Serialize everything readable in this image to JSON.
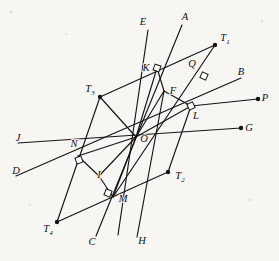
{
  "figure": {
    "ink_color": "#161412",
    "paper_color": "#f7f6f3",
    "width": 279,
    "height": 261
  },
  "points": [
    {
      "id": "A",
      "label": "A",
      "sub": "",
      "x": 185,
      "y": 18,
      "lx": 185,
      "ly": 18,
      "dot": false
    },
    {
      "id": "E",
      "label": "E",
      "sub": "",
      "x": 143,
      "y": 23,
      "lx": 143,
      "ly": 23,
      "dot": false
    },
    {
      "id": "T1",
      "label": "T",
      "sub": "1",
      "x": 215,
      "y": 45,
      "lx": 225,
      "ly": 39,
      "dot": true
    },
    {
      "id": "B",
      "label": "B",
      "sub": "",
      "x": 241,
      "y": 73,
      "lx": 241,
      "ly": 73,
      "dot": false
    },
    {
      "id": "K",
      "label": "K",
      "sub": "",
      "x": 157,
      "y": 68,
      "lx": 146,
      "ly": 69,
      "dot": false
    },
    {
      "id": "Q",
      "label": "Q",
      "sub": "",
      "x": 204,
      "y": 76,
      "lx": 192,
      "ly": 65,
      "dot": false
    },
    {
      "id": "P",
      "label": "P",
      "sub": "",
      "x": 258,
      "y": 99,
      "lx": 265,
      "ly": 99,
      "dot": true
    },
    {
      "id": "T3",
      "label": "T",
      "sub": "3",
      "x": 100,
      "y": 97,
      "lx": 90,
      "ly": 90,
      "dot": true
    },
    {
      "id": "F",
      "label": "F",
      "sub": "",
      "x": 164,
      "y": 91,
      "lx": 173,
      "ly": 92,
      "dot": false
    },
    {
      "id": "L",
      "label": "L",
      "sub": "",
      "x": 191,
      "y": 106,
      "lx": 196,
      "ly": 117,
      "dot": false
    },
    {
      "id": "G",
      "label": "G",
      "sub": "",
      "x": 241,
      "y": 128,
      "lx": 249,
      "ly": 129,
      "dot": true
    },
    {
      "id": "J",
      "label": "J",
      "sub": "",
      "x": 18,
      "y": 139,
      "lx": 18,
      "ly": 139,
      "dot": false
    },
    {
      "id": "O",
      "label": "O",
      "sub": "",
      "x": 136,
      "y": 137,
      "lx": 144,
      "ly": 140,
      "dot": false
    },
    {
      "id": "N",
      "label": "N",
      "sub": "",
      "x": 78,
      "y": 156,
      "lx": 74,
      "ly": 145,
      "dot": false
    },
    {
      "id": "D",
      "label": "D",
      "sub": "",
      "x": 16,
      "y": 172,
      "lx": 16,
      "ly": 172,
      "dot": false
    },
    {
      "id": "I",
      "label": "I",
      "sub": "",
      "x": 99,
      "y": 176,
      "lx": 99,
      "ly": 176,
      "dot": false
    },
    {
      "id": "T2",
      "label": "T",
      "sub": "2",
      "x": 168,
      "y": 172,
      "lx": 180,
      "ly": 177,
      "dot": true
    },
    {
      "id": "M",
      "label": "M",
      "sub": "",
      "x": 113,
      "y": 197,
      "lx": 123,
      "ly": 200,
      "dot": false
    },
    {
      "id": "T4",
      "label": "T",
      "sub": "4",
      "x": 57,
      "y": 222,
      "lx": 48,
      "ly": 230,
      "dot": true
    },
    {
      "id": "C",
      "label": "C",
      "sub": "",
      "x": 92,
      "y": 243,
      "lx": 92,
      "ly": 243,
      "dot": false
    },
    {
      "id": "H",
      "label": "H",
      "sub": "",
      "x": 142,
      "y": 242,
      "lx": 142,
      "ly": 242,
      "dot": false
    }
  ],
  "segments": [
    {
      "name": "line-E-to-M",
      "x1": 148,
      "y1": 30,
      "x2": 118,
      "y2": 235
    },
    {
      "name": "line-A-to-C",
      "x1": 182,
      "y1": 25,
      "x2": 96,
      "y2": 236
    },
    {
      "name": "line-T1-to-M-chain",
      "x1": 215,
      "y1": 45,
      "x2": 113,
      "y2": 197
    },
    {
      "name": "line-K-to-T1",
      "x1": 100,
      "y1": 97,
      "x2": 215,
      "y2": 45
    },
    {
      "name": "line-T3-to-T4",
      "x1": 100,
      "y1": 97,
      "x2": 57,
      "y2": 222
    },
    {
      "name": "line-T4-to-T2",
      "x1": 57,
      "y1": 222,
      "x2": 168,
      "y2": 172
    },
    {
      "name": "line-T2-to-L",
      "x1": 168,
      "y1": 172,
      "x2": 191,
      "y2": 106
    },
    {
      "name": "line-J-to-G",
      "x1": 18,
      "y1": 143,
      "x2": 241,
      "y2": 128
    },
    {
      "name": "line-D-to-B",
      "x1": 16,
      "y1": 176,
      "x2": 241,
      "y2": 78
    },
    {
      "name": "line-P-ray",
      "x1": 191,
      "y1": 106,
      "x2": 258,
      "y2": 99
    },
    {
      "name": "line-O-to-K",
      "x1": 136,
      "y1": 137,
      "x2": 157,
      "y2": 68
    },
    {
      "name": "line-O-to-F",
      "x1": 136,
      "y1": 137,
      "x2": 164,
      "y2": 91
    },
    {
      "name": "line-F-to-K",
      "x1": 164,
      "y1": 91,
      "x2": 157,
      "y2": 68
    },
    {
      "name": "line-F-to-L",
      "x1": 164,
      "y1": 91,
      "x2": 191,
      "y2": 106
    },
    {
      "name": "line-O-to-L",
      "x1": 136,
      "y1": 137,
      "x2": 191,
      "y2": 106
    },
    {
      "name": "line-O-to-N",
      "x1": 136,
      "y1": 137,
      "x2": 78,
      "y2": 156
    },
    {
      "name": "line-O-to-I",
      "x1": 136,
      "y1": 137,
      "x2": 99,
      "y2": 176
    },
    {
      "name": "line-I-to-N",
      "x1": 99,
      "y1": 176,
      "x2": 78,
      "y2": 156
    },
    {
      "name": "line-I-to-M",
      "x1": 99,
      "y1": 176,
      "x2": 113,
      "y2": 197
    },
    {
      "name": "line-O-to-M",
      "x1": 136,
      "y1": 137,
      "x2": 113,
      "y2": 197
    },
    {
      "name": "line-H-to-K-long",
      "x1": 137,
      "y1": 237,
      "x2": 164,
      "y2": 91
    },
    {
      "name": "line-T3-to-O",
      "x1": 100,
      "y1": 97,
      "x2": 136,
      "y2": 137
    }
  ],
  "right_angle_marks": [
    {
      "name": "right-angle-at-K",
      "x": 157,
      "y": 68,
      "rot": 20
    },
    {
      "name": "right-angle-at-Q",
      "x": 204,
      "y": 76,
      "rot": 25
    },
    {
      "name": "right-angle-at-L",
      "x": 191,
      "y": 106,
      "rot": -25
    },
    {
      "name": "right-angle-at-N",
      "x": 79,
      "y": 160,
      "rot": -22
    },
    {
      "name": "right-angle-at-M",
      "x": 108,
      "y": 193,
      "rot": 22
    }
  ],
  "labels_legend": {
    "point_labels": [
      "A",
      "E",
      "T1",
      "B",
      "K",
      "Q",
      "P",
      "T3",
      "F",
      "L",
      "G",
      "J",
      "O",
      "N",
      "D",
      "I",
      "T2",
      "M",
      "T4",
      "C",
      "H"
    ],
    "subscripted": [
      "T1",
      "T2",
      "T3",
      "T4"
    ]
  }
}
